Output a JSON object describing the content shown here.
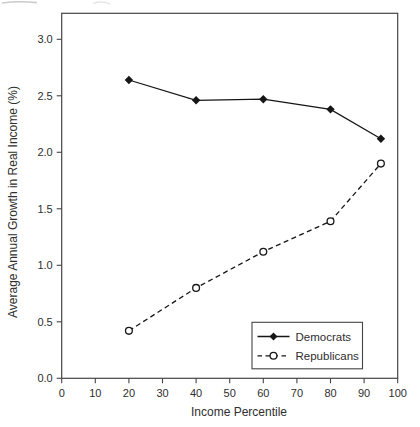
{
  "figure": {
    "background": "#ffffff",
    "ink_color": "#161616",
    "frame_color": "#454545",
    "text_color": "#2e2e2e"
  },
  "chart_data": {
    "type": "line",
    "title": "",
    "xlabel": "Income Percentile",
    "ylabel": "Average Annual Growth in Real Income (%)",
    "xlim": [
      0,
      100
    ],
    "ylim": [
      0,
      3.23
    ],
    "x_ticks": [
      0,
      10,
      20,
      30,
      40,
      50,
      60,
      70,
      80,
      90,
      100
    ],
    "y_ticks": [
      0.0,
      0.5,
      1.0,
      1.5,
      2.0,
      2.5,
      3.0
    ],
    "grid": false,
    "x": [
      20,
      40,
      60,
      80,
      95
    ],
    "series": [
      {
        "name": "Democrats",
        "line_style": "solid",
        "marker": "filled-diamond",
        "values": [
          2.64,
          2.46,
          2.47,
          2.38,
          2.12
        ]
      },
      {
        "name": "Republicans",
        "line_style": "dashed",
        "marker": "open-circle",
        "values": [
          0.42,
          0.8,
          1.12,
          1.39,
          1.9
        ]
      }
    ],
    "legend": {
      "position": "inside-bottom-right",
      "entries": [
        "Democrats",
        "Republicans"
      ]
    }
  }
}
